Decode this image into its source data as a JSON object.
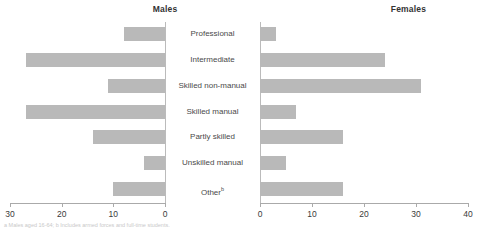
{
  "panels": {
    "left_title": "Males",
    "right_title": "Females"
  },
  "footnote": "a Males aged 16-64; b Includes armed forces and full-time students.",
  "chart_data": {
    "type": "bar",
    "title": "",
    "orientation": "horizontal",
    "layout": "population-pyramid",
    "categories": [
      "Professional",
      "Intermediate",
      "Skilled non-manual",
      "Skilled manual",
      "Partly skilled",
      "Unskilled manual",
      "Other"
    ],
    "category_superscripts": [
      "",
      "",
      "",
      "",
      "",
      "",
      "b"
    ],
    "series": [
      {
        "name": "Males",
        "side": "left",
        "values": [
          8,
          27,
          11,
          27,
          14,
          4,
          10
        ],
        "axis": {
          "min": 0,
          "max": 30,
          "reversed": true,
          "ticks": [
            30,
            20,
            10,
            0
          ],
          "tick_labels": [
            "30",
            "20",
            "10",
            "0"
          ]
        }
      },
      {
        "name": "Females",
        "side": "right",
        "values": [
          3,
          24,
          31,
          7,
          16,
          5,
          16
        ],
        "axis": {
          "min": 0,
          "max": 40,
          "reversed": false,
          "ticks": [
            0,
            10,
            20,
            30,
            40
          ],
          "tick_labels": [
            "0",
            "10",
            "20",
            "30",
            "40"
          ]
        }
      }
    ],
    "xlabel": "",
    "ylabel": "",
    "grid": false,
    "legend": "none",
    "bar_color": "#b9b9b9",
    "axis_color": "#aaaaaa"
  }
}
